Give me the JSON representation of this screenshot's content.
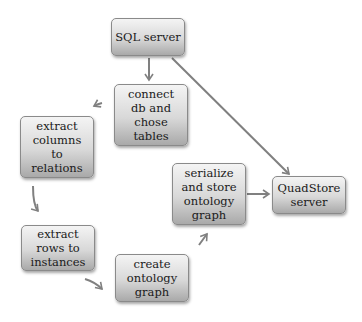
{
  "diagram": {
    "type": "flowchart",
    "nodes": [
      {
        "id": "sql",
        "label": "SQL server"
      },
      {
        "id": "connect",
        "label": "connect\ndb and\nchose\ntables"
      },
      {
        "id": "columns",
        "label": "extract\ncolumns\nto\nrelations"
      },
      {
        "id": "rows",
        "label": "extract\nrows to\ninstances"
      },
      {
        "id": "create",
        "label": "create\nontology\ngraph"
      },
      {
        "id": "serialize",
        "label": "serialize\nand store\nontology\ngraph"
      },
      {
        "id": "quadstore",
        "label": "QuadStore\nserver"
      }
    ],
    "edges": [
      {
        "from": "sql",
        "to": "connect",
        "style": "straight"
      },
      {
        "from": "sql",
        "to": "quadstore",
        "style": "straight"
      },
      {
        "from": "connect",
        "to": "columns",
        "style": "curved"
      },
      {
        "from": "columns",
        "to": "rows",
        "style": "curved"
      },
      {
        "from": "rows",
        "to": "create",
        "style": "curved"
      },
      {
        "from": "create",
        "to": "serialize",
        "style": "curved"
      },
      {
        "from": "serialize",
        "to": "quadstore",
        "style": "straight"
      }
    ],
    "colors": {
      "edge": "#808080",
      "node_border": "#8a8a8a",
      "text": "#1a1a1a"
    }
  }
}
